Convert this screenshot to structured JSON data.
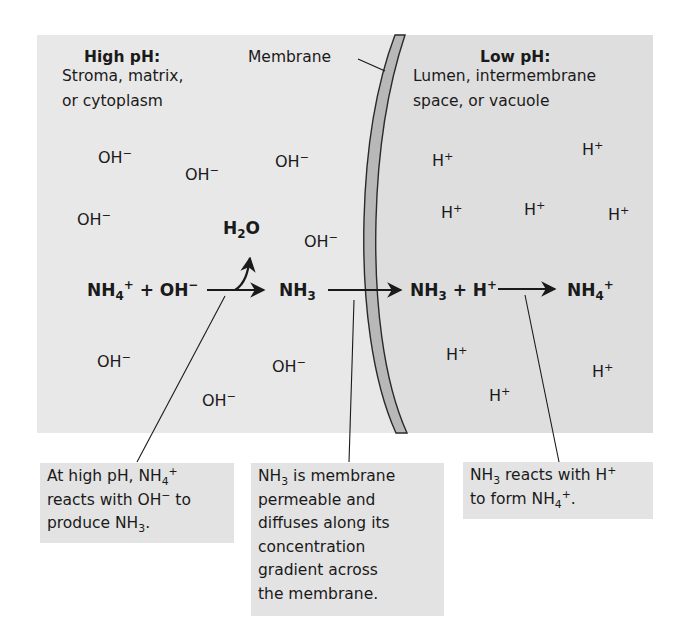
{
  "colors": {
    "high_ph_region": "#e8e8e8",
    "low_ph_region": "#dedede",
    "membrane_fill": "#b8b8b8",
    "membrane_stroke": "#2a2a2a",
    "callout_bg": "#e3e3e3",
    "text": "#1a1a1a"
  },
  "high_ph": {
    "title": "High pH:",
    "line1": "Stroma, matrix,",
    "line2": "or cytoplasm",
    "ion_label": "OH",
    "ion_charge": "−"
  },
  "membrane_label": "Membrane",
  "low_ph": {
    "title": "Low pH:",
    "line1": "Lumen, intermembrane",
    "line2": "space, or vacuole",
    "ion_label": "H",
    "ion_charge": "+"
  },
  "reaction": {
    "nh4": "NH",
    "nh4_sub": "4",
    "nh4_sup": "+",
    "plus": "+",
    "oh": "OH",
    "oh_sup": "−",
    "h2o_h": "H",
    "h2o_sub": "2",
    "h2o_o": "O",
    "nh3": "NH",
    "nh3_sub": "3",
    "h": "H",
    "h_sup": "+"
  },
  "callouts": {
    "left": {
      "l1a": "At high pH, NH",
      "l1_sub": "4",
      "l1_sup": "+",
      "l2a": "reacts with OH",
      "l2_sup": "−",
      "l2b": " to",
      "l3a": "produce NH",
      "l3_sub": "3",
      "l3b": "."
    },
    "middle": {
      "l1a": "NH",
      "l1_sub": "3",
      "l1b": " is membrane",
      "l2": "permeable and",
      "l3": "diffuses along its",
      "l4": "concentration",
      "l5": "gradient across",
      "l6": "the membrane."
    },
    "right": {
      "l1a": "NH",
      "l1_sub": "3",
      "l1b": " reacts with H",
      "l1_sup": "+",
      "l2a": "to form NH",
      "l2_sub": "4",
      "l2_sup": "+",
      "l2b": "."
    }
  }
}
